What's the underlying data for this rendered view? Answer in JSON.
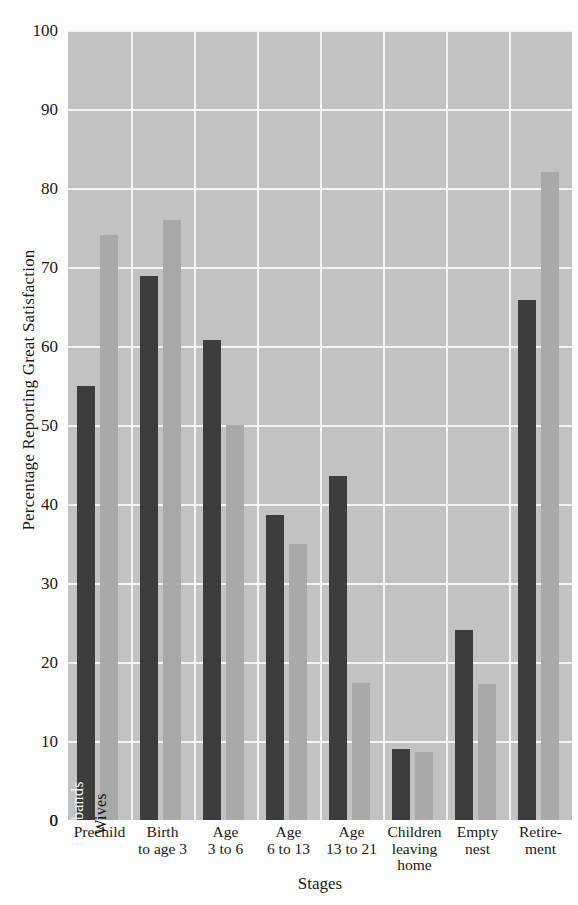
{
  "chart_data": {
    "type": "bar",
    "title": "",
    "xlabel": "Stages",
    "ylabel": "Percentage Reporting Great Satisfaction",
    "ylim": [
      0,
      100
    ],
    "ytick_values": [
      0,
      10,
      20,
      30,
      40,
      50,
      60,
      70,
      80,
      90,
      100
    ],
    "ytick_labels": [
      "0",
      "10",
      "20",
      "30",
      "40",
      "50",
      "60",
      "70",
      "80",
      "90",
      "100"
    ],
    "grid": true,
    "legend_position": "inside-first-group",
    "categories": [
      "Prechild",
      "Birth to age 3",
      "Age 3 to 6",
      "Age 6 to 13",
      "Age 13 to 21",
      "Children leaving home",
      "Empty nest",
      "Retirement"
    ],
    "category_lines": [
      [
        "Prechild"
      ],
      [
        "Birth",
        "to age 3"
      ],
      [
        "Age",
        "3 to 6"
      ],
      [
        "Age",
        "6 to 13"
      ],
      [
        "Age",
        "13 to 21"
      ],
      [
        "Children",
        "leaving",
        "home"
      ],
      [
        "Empty",
        "nest"
      ],
      [
        "Retire-",
        "ment"
      ]
    ],
    "series": [
      {
        "name": "Husbands",
        "color": "#3d3d3d",
        "values": [
          55,
          68.8,
          60.8,
          38.6,
          43.6,
          9,
          24,
          65.8
        ]
      },
      {
        "name": "Wives",
        "color": "#a9a9a9",
        "values": [
          74,
          76,
          50,
          35,
          17.3,
          8.6,
          17.2,
          82
        ]
      }
    ]
  },
  "colors": {
    "plot_background": "#c2c2c2",
    "page_background": "#fdfdfd",
    "gridline": "#f4f4f4",
    "husbands": "#3d3d3d",
    "wives": "#a9a9a9",
    "text": "#1a1a1a"
  }
}
